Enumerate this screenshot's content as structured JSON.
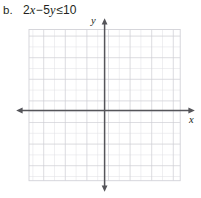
{
  "problem": {
    "label": "b.",
    "expression_text": "2x − 5y ≤ 10",
    "coefficient_x": "2",
    "var_x": "x",
    "operator": "−",
    "coefficient_y": "5",
    "var_y": "y",
    "relation": "≤",
    "constant": "10"
  },
  "graph": {
    "x_axis_label": "x",
    "y_axis_label": "y",
    "grid": {
      "columns": 14,
      "rows": 14,
      "cell_size_px": 10.8,
      "minor_color": "#dcdce0",
      "major_color": "#c8c8cf",
      "major_every": 2
    },
    "axes": {
      "color": "#55555a",
      "width_px": 1.4,
      "origin_x_px": 104.5,
      "origin_y_px": 96.5,
      "arrowheads": [
        "up",
        "down",
        "left",
        "right"
      ]
    },
    "plotted_curve": null,
    "shaded_region": null
  },
  "colors": {
    "background": "#ffffff",
    "text": "#231f20",
    "axis": "#55555a",
    "grid_minor": "#dcdce0",
    "grid_major": "#c8c8cf"
  }
}
